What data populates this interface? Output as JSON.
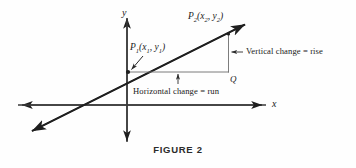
{
  "figure": {
    "caption": "FIGURE 2",
    "caption_x": 178,
    "caption_y": 143,
    "background_color": "#fefefe",
    "ink_color": "#1f1f1f",
    "thin_color": "#6e6e6e"
  },
  "axes": {
    "x_label": "x",
    "y_label": "y",
    "x_label_pos": {
      "x": 272,
      "y": 100
    },
    "y_label_pos": {
      "x": 122,
      "y": 9
    },
    "origin": {
      "x": 127,
      "y": 105
    },
    "x_axis": {
      "x1": 16,
      "y1": 105,
      "x2": 266,
      "y2": 105
    },
    "y_axis": {
      "x1": 127,
      "y1": 14,
      "x2": 127,
      "y2": 146
    }
  },
  "line": {
    "description": "line through P1 and P2 with arrowheads at both ends",
    "start": {
      "x": 28,
      "y": 133
    },
    "end": {
      "x": 250,
      "y": 22
    },
    "x_intercept_x": 82
  },
  "points": {
    "p1": {
      "base": "P",
      "sub": "1",
      "coords_open": "(",
      "cx": "x",
      "csub1": "1",
      "comma": ", ",
      "cy": "y",
      "csub2": "1",
      "coords_close": ")",
      "label_pos": {
        "x": 130,
        "y": 44
      },
      "dot": {
        "x": 128,
        "y": 72
      }
    },
    "p2": {
      "base": "P",
      "sub": "2",
      "coords_open": "(",
      "cx": "x",
      "csub1": "2",
      "comma": ", ",
      "cy": "y",
      "csub2": "2",
      "coords_close": ")",
      "label_pos": {
        "x": 188,
        "y": 13
      },
      "dot": {
        "x": 228,
        "y": 34
      }
    },
    "q": {
      "label": "Q",
      "label_pos": {
        "x": 230,
        "y": 76
      },
      "corner": {
        "x": 228,
        "y": 72
      }
    }
  },
  "annotations": {
    "vertical": {
      "text": "Vertical change = rise",
      "pos": {
        "x": 245,
        "y": 48
      },
      "arrow_from": {
        "x": 243,
        "y": 52
      },
      "arrow_to": {
        "x": 230,
        "y": 52
      }
    },
    "horizontal": {
      "text": "Horizontal change = run",
      "pos": {
        "x": 133,
        "y": 86
      },
      "arrow_from": {
        "x": 178,
        "y": 84
      },
      "arrow_to": {
        "x": 178,
        "y": 74
      }
    }
  },
  "triangle": {
    "run_segment": {
      "x1": 128,
      "y1": 72,
      "x2": 228,
      "y2": 72
    },
    "rise_segment": {
      "x1": 228,
      "y1": 72,
      "x2": 228,
      "y2": 34
    }
  }
}
